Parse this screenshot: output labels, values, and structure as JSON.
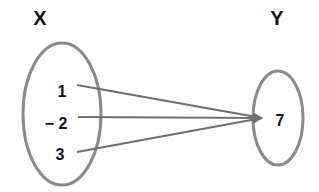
{
  "diagram": {
    "type": "mapping",
    "domain_label": "X",
    "codomain_label": "Y",
    "domain_elements": [
      "1",
      "− 2",
      "3"
    ],
    "codomain_elements": [
      "7"
    ],
    "arrows": [
      {
        "from": "1",
        "to": "7"
      },
      {
        "from": "-2",
        "to": "7"
      },
      {
        "from": "3",
        "to": "7"
      }
    ],
    "colors": {
      "ellipse": "#8a8a8a",
      "arrow": "#6f6f6f",
      "text": "#111111"
    }
  }
}
